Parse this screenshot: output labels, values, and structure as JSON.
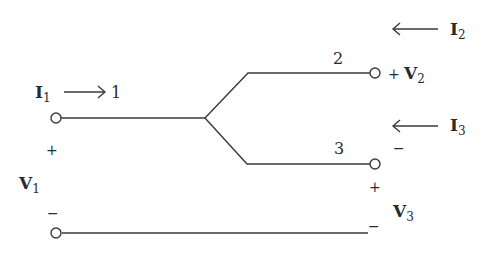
{
  "diagram": {
    "type": "three-port network schematic",
    "ports": [
      {
        "id": "1",
        "label": "1",
        "current": {
          "symbol": "I",
          "sub": "1",
          "direction": "into node"
        },
        "voltage": {
          "symbol": "V",
          "sub": "1",
          "plus": "+",
          "minus": "−"
        }
      },
      {
        "id": "2",
        "label": "2",
        "current": {
          "symbol": "I",
          "sub": "2",
          "direction": "into node"
        },
        "voltage": {
          "symbol": "V",
          "sub": "2",
          "plus": "+",
          "minus": "−"
        }
      },
      {
        "id": "3",
        "label": "3",
        "current": {
          "symbol": "I",
          "sub": "3",
          "direction": "into node"
        },
        "voltage": {
          "symbol": "V",
          "sub": "3",
          "plus": "+",
          "minus": "−"
        }
      }
    ],
    "labels": {
      "i1": "I",
      "i1_sub": "1",
      "i2": "I",
      "i2_sub": "2",
      "i3": "I",
      "i3_sub": "3",
      "v1": "V",
      "v1_sub": "1",
      "v2": "V",
      "v2_sub": "2",
      "v3": "V",
      "v3_sub": "3",
      "port1": "1",
      "port2": "2",
      "port3": "3",
      "plus": "+",
      "minus": "−"
    },
    "stroke_color": "#3a3a3a"
  }
}
